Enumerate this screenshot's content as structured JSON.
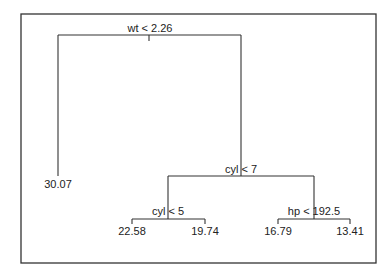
{
  "diagram": {
    "type": "regression-tree",
    "root": {
      "id": "n1",
      "split": "wt < 2.26",
      "left": {
        "id": "n2",
        "leaf": "30.07"
      },
      "right": {
        "id": "n3",
        "split": "cyl < 7",
        "left": {
          "id": "n4",
          "split": "cyl < 5",
          "left": {
            "id": "n6",
            "leaf": "22.58"
          },
          "right": {
            "id": "n7",
            "leaf": "19.74"
          }
        },
        "right": {
          "id": "n5",
          "split": "hp < 192.5",
          "left": {
            "id": "n8",
            "leaf": "16.79"
          },
          "right": {
            "id": "n9",
            "leaf": "13.41"
          }
        }
      }
    },
    "splits": {
      "root": "wt < 2.26",
      "cyl7": "cyl < 7",
      "cyl5": "cyl < 5",
      "hp": "hp < 192.5"
    },
    "leaves": {
      "n2": "30.07",
      "n6": "22.58",
      "n7": "19.74",
      "n8": "16.79",
      "n9": "13.41"
    },
    "colors": {
      "line": "#333333",
      "text": "#222222",
      "background": "#ffffff"
    }
  }
}
